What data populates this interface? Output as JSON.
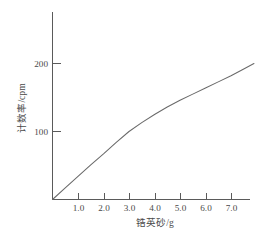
{
  "chart_data": {
    "type": "line",
    "title": "",
    "xlabel": "锆英砂/g",
    "ylabel": "计数率/cpm",
    "xlim": [
      0,
      7.9
    ],
    "ylim": [
      0,
      215
    ],
    "grid": false,
    "legend": null,
    "x_ticks": [
      "1.0",
      "2.0",
      "3.0",
      "4.0",
      "5.0",
      "6.0",
      "7.0"
    ],
    "x_tick_values": [
      1.0,
      2.0,
      3.0,
      4.0,
      5.0,
      6.0,
      7.0
    ],
    "y_ticks": [
      "100",
      "200"
    ],
    "y_tick_values": [
      100,
      200
    ],
    "series": [
      {
        "name": "计数率",
        "x": [
          0.0,
          0.5,
          1.0,
          1.5,
          2.0,
          2.5,
          3.0,
          3.5,
          4.0,
          4.5,
          5.0,
          5.5,
          6.0,
          6.5,
          7.0,
          7.5,
          7.9
        ],
        "values": [
          0,
          17,
          34,
          51,
          67,
          84,
          100,
          113,
          125,
          136,
          146,
          155,
          164,
          173,
          182,
          192,
          200
        ]
      }
    ]
  },
  "axis_labels": {
    "x_title": "锆英砂/g",
    "y_title": "计数率/cpm"
  },
  "colors": {
    "curve": "#6a6a6a",
    "axis": "#5a5a5a",
    "text": "#4a4a4a",
    "background": "#ffffff"
  }
}
